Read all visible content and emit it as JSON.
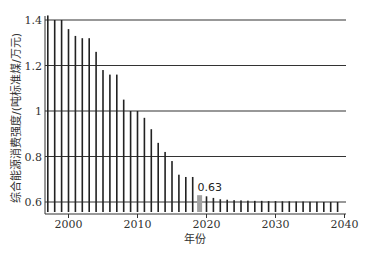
{
  "chart_data": {
    "type": "bar",
    "title": "",
    "xlabel": "年份",
    "ylabel": "综合能源消费强度/(吨标准煤/万元)",
    "ylim": [
      0.555,
      1.4
    ],
    "xlim": [
      1996.5,
      2040.5
    ],
    "grid": {
      "horizontal": true,
      "vertical": false
    },
    "yticks": [
      0.6,
      0.8,
      1,
      1.2,
      1.4
    ],
    "ytick_labels": [
      "0.6",
      "0.8",
      "1",
      "1.2",
      "1.4"
    ],
    "xticks": [
      2000,
      2010,
      2020,
      2030,
      2040
    ],
    "xtick_labels": [
      "2000",
      "2010",
      "2020",
      "2030",
      "2040"
    ],
    "highlight": {
      "year": 2019,
      "value": 0.63,
      "label": "0.63",
      "color": "#a0a0a0"
    },
    "bar_color": "#222222",
    "categories": [
      1997,
      1998,
      1999,
      2000,
      2001,
      2002,
      2003,
      2004,
      2005,
      2006,
      2007,
      2008,
      2009,
      2010,
      2011,
      2012,
      2013,
      2014,
      2015,
      2016,
      2017,
      2018,
      2019,
      2020,
      2021,
      2022,
      2023,
      2024,
      2025,
      2026,
      2027,
      2028,
      2029,
      2030,
      2031,
      2032,
      2033,
      2034,
      2035,
      2036,
      2037,
      2038,
      2039
    ],
    "values": [
      1.42,
      1.4,
      1.4,
      1.36,
      1.33,
      1.32,
      1.32,
      1.26,
      1.18,
      1.16,
      1.16,
      1.05,
      1.0,
      1.0,
      0.97,
      0.92,
      0.86,
      0.82,
      0.78,
      0.72,
      0.71,
      0.71,
      0.63,
      0.625,
      0.618,
      0.612,
      0.61,
      0.608,
      0.607,
      0.606,
      0.605,
      0.605,
      0.604,
      0.604,
      0.603,
      0.603,
      0.602,
      0.602,
      0.601,
      0.601,
      0.6,
      0.6,
      0.6
    ],
    "legend": null
  }
}
